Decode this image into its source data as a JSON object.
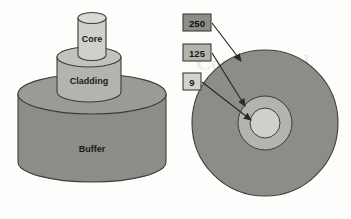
{
  "figure": {
    "background_color": "#fdfdfc"
  },
  "colors": {
    "core_fill": "#cfcfcb",
    "core_top": "#d9d9d5",
    "cladding_fill": "#b4b4ae",
    "cladding_top": "#c3c3bd",
    "buffer_fill": "#8c8c88",
    "buffer_top": "#9a9a96",
    "outline": "#3c3c3a",
    "label_box_250_fill": "#8c8c88",
    "label_box_125_fill": "#b4b4ae",
    "label_box_9_fill": "#d2d2ce",
    "label_box_border": "#3c3c3a",
    "arrow_color": "#2a2a28",
    "text_color": "#1a1a1a",
    "watermark_color": "#e8e5e0"
  },
  "left_diagram": {
    "name": "stacked-cylinders",
    "cylinders": [
      {
        "id": "core",
        "label": "Core",
        "fill_key": "core_fill"
      },
      {
        "id": "cladding",
        "label": "Cladding",
        "fill_key": "cladding_fill"
      },
      {
        "id": "buffer",
        "label": "Buffer",
        "fill_key": "buffer_fill"
      }
    ]
  },
  "right_diagram": {
    "name": "cross-section",
    "rings": [
      {
        "id": "buffer",
        "label": "250",
        "units_implied": "micrometers",
        "radius_px": 73
      },
      {
        "id": "cladding",
        "label": "125",
        "units_implied": "micrometers",
        "radius_px": 27
      },
      {
        "id": "core",
        "label": "9",
        "units_implied": "micrometers",
        "radius_px": 15
      }
    ],
    "callouts": [
      {
        "id": "callout-250",
        "text": "250",
        "box": {
          "x": 183,
          "y": 14,
          "w": 28,
          "h": 17
        },
        "arrow_from": {
          "x": 212,
          "y": 23
        },
        "arrow_to": {
          "x": 243,
          "y": 63
        }
      },
      {
        "id": "callout-125",
        "text": "125",
        "box": {
          "x": 183,
          "y": 44,
          "w": 28,
          "h": 17
        },
        "arrow_from": {
          "x": 212,
          "y": 53
        },
        "arrow_to": {
          "x": 247,
          "y": 108
        }
      },
      {
        "id": "callout-9",
        "text": "9",
        "box": {
          "x": 183,
          "y": 73,
          "w": 18,
          "h": 17
        },
        "arrow_from": {
          "x": 202,
          "y": 82
        },
        "arrow_to": {
          "x": 253,
          "y": 122
        }
      }
    ]
  },
  "watermark": {
    "visible": true,
    "text": "Copyrighted Material"
  }
}
